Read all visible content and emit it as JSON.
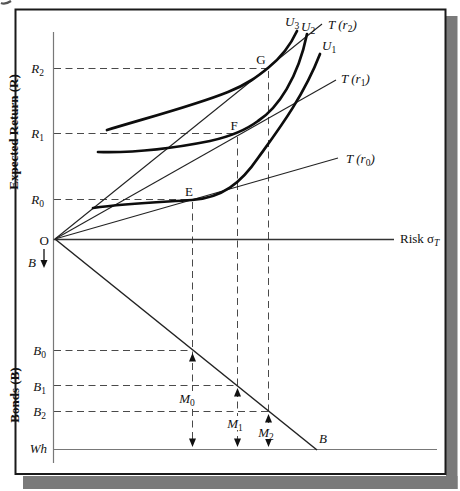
{
  "figure": {
    "type": "economics-diagram",
    "upper_panel": "risk-return portfolio choice with indifference curves",
    "lower_panel": "bond/money allocation of wealth"
  },
  "labels": {
    "origin": "O",
    "y_axis_upper_title": "Expected Return (R)",
    "y_axis_lower_title": "Bonds (B)",
    "x_axis": {
      "pre": "Risk σ",
      "sub": "T"
    },
    "r_ticks": {
      "r2": {
        "m": "R",
        "s": "2"
      },
      "r1": {
        "m": "R",
        "s": "1"
      },
      "r0": {
        "m": "R",
        "s": "0"
      }
    },
    "b_ticks": {
      "b0": {
        "m": "B",
        "s": "0"
      },
      "b1": {
        "m": "B",
        "s": "1"
      },
      "b2": {
        "m": "B",
        "s": "2"
      },
      "wealth": "Wh"
    },
    "points": {
      "e": "E",
      "f": "F",
      "g": "G"
    },
    "utility_curves": {
      "u3": {
        "m": "U",
        "s": "3"
      },
      "u2": {
        "m": "U",
        "s": "2"
      },
      "u1": {
        "m": "U",
        "s": "1"
      }
    },
    "t_lines": {
      "t2": {
        "pre": "T (r",
        "s": "2",
        "post": ")"
      },
      "t1": {
        "pre": "T (r",
        "s": "1",
        "post": ")"
      },
      "t0": {
        "pre": "T (r",
        "s": "0",
        "post": ")"
      }
    },
    "money": {
      "m0": {
        "m": "M",
        "s": "0"
      },
      "m1": {
        "m": "M",
        "s": "1"
      },
      "m2": {
        "m": "M",
        "s": "2"
      }
    },
    "bonds_axis_arrow": "B",
    "bonds_line": "B"
  },
  "colors": {
    "ink": "#111111",
    "frame": "#1a1a1a",
    "shadow": "#7a7a7a",
    "dashed": "#4a4a4a",
    "background": "#ffffff"
  }
}
